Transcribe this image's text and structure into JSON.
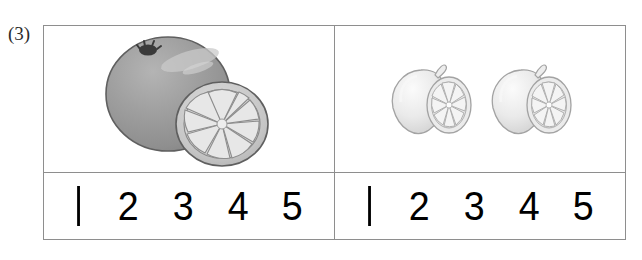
{
  "worksheet": {
    "question_label": "(3)",
    "cells": [
      {
        "id": "left",
        "picture": {
          "name": "orange-with-half-slice",
          "items": [
            {
              "icon": "whole-orange-icon",
              "fill": "#9a9a9a",
              "outline": "#5d5d5d"
            },
            {
              "icon": "orange-half-slice-icon",
              "fill": "#d0d0d0",
              "outline": "#6a6a6a",
              "segments": 10
            }
          ]
        },
        "numbers": [
          "1",
          "2",
          "3",
          "4",
          "5"
        ]
      },
      {
        "id": "right",
        "picture": {
          "name": "two-lemons-with-half-slices",
          "items": [
            {
              "icon": "whole-lemon-icon",
              "fill": "#e8e8e8",
              "outline": "#9c9c9c"
            },
            {
              "icon": "lemon-half-slice-icon",
              "fill": "#efefef",
              "outline": "#a2a2a2",
              "segments": 9
            },
            {
              "icon": "whole-lemon-icon",
              "fill": "#e8e8e8",
              "outline": "#9c9c9c"
            },
            {
              "icon": "lemon-half-slice-icon",
              "fill": "#efefef",
              "outline": "#a2a2a2",
              "segments": 9
            }
          ]
        },
        "numbers": [
          "1",
          "2",
          "3",
          "4",
          "5"
        ]
      }
    ]
  },
  "colors": {
    "border": "#8e8e8e",
    "numeral": "#000000",
    "label": "#2b2b2b",
    "background": "#ffffff"
  }
}
